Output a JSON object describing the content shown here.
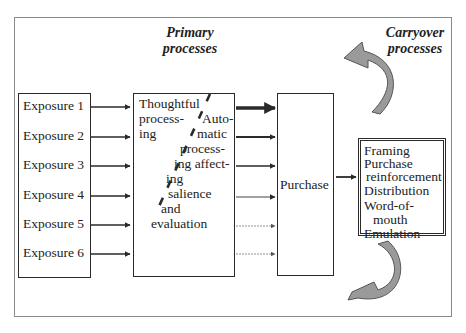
{
  "diagram": {
    "titles": {
      "primary": [
        "Primary",
        "processes"
      ],
      "carryover": [
        "Carryover",
        "processes"
      ]
    },
    "exposures": [
      "Exposure 1",
      "Exposure 2",
      "Exposure 3",
      "Exposure 4",
      "Exposure 5",
      "Exposure 6"
    ],
    "processing": {
      "thoughtful": [
        "Thoughtful",
        "process-",
        "ing"
      ],
      "automatic": [
        "Auto-",
        "matic",
        "process-",
        "ing affect-",
        "ing",
        "salience",
        "and",
        "evaluation"
      ]
    },
    "purchase": "Purchase",
    "carryover_items": [
      "Framing",
      "Purchase",
      "reinforcement",
      "Distribution",
      "Word-of-",
      "mouth",
      "Emulation"
    ],
    "icons": {
      "top_curved_arrow": "curved-arrow-left-icon",
      "bottom_curved_arrow": "curved-arrow-left-icon"
    },
    "colors": {
      "line": "#2a2a2a",
      "frame": "#8a8a8a",
      "curved_arrow_fill": "#9a9a9a",
      "curved_arrow_stroke": "#555555"
    }
  }
}
